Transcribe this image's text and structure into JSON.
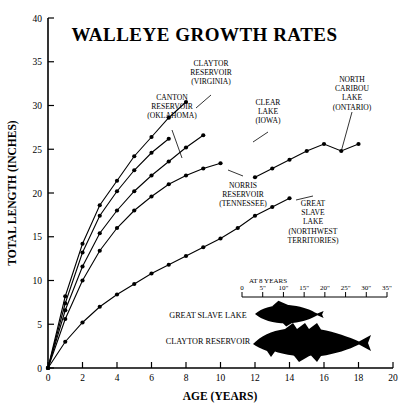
{
  "chart_data": {
    "type": "line",
    "title": "WALLEYE GROWTH RATES",
    "xlabel": "AGE (YEARS)",
    "ylabel": "TOTAL LENGTH (INCHES)",
    "xlim": [
      0,
      20
    ],
    "ylim": [
      0,
      40
    ],
    "xticks": [
      0,
      2,
      4,
      6,
      8,
      10,
      12,
      14,
      16,
      18,
      20
    ],
    "yticks": [
      0,
      5,
      10,
      15,
      20,
      25,
      30,
      35,
      40
    ],
    "grid": false,
    "legend": "inline-annotations",
    "series": [
      {
        "name": "CLAYTOR RESERVOIR (VIRGINIA)",
        "label_lines": [
          "CLAYTOR",
          "RESERVOIR",
          "(VIRGINIA)"
        ],
        "x": [
          0,
          1,
          2,
          3,
          4,
          5,
          6,
          7,
          8
        ],
        "y": [
          0,
          8.2,
          14.2,
          18.6,
          21.4,
          24.2,
          26.4,
          28.6,
          30.4
        ]
      },
      {
        "name": "CANTON RESERVOIR (OKLAHOMA)",
        "label_lines": [
          "CANTON",
          "RESERVOIR",
          "(OKLAHOMA)"
        ],
        "x": [
          0,
          1,
          2,
          3,
          4,
          5,
          6,
          7
        ],
        "y": [
          0,
          7.4,
          13.2,
          17.4,
          20.2,
          22.6,
          24.6,
          26.2
        ]
      },
      {
        "name": "CLEAR LAKE (IOWA)",
        "label_lines": [
          "CLEAR",
          "LAKE",
          "(IOWA)"
        ],
        "x": [
          0,
          1,
          2,
          3,
          4,
          5,
          6,
          7,
          8,
          9
        ],
        "y": [
          0,
          6.6,
          11.6,
          15.4,
          18.0,
          20.2,
          22.0,
          23.6,
          25.2,
          26.6
        ]
      },
      {
        "name": "NORRIS RESERVOIR (TENNESSEE)",
        "label_lines": [
          "NORRIS",
          "RESERVOIR",
          "(TENNESSEE)"
        ],
        "x": [
          0,
          1,
          2,
          3,
          4,
          5,
          6,
          7,
          8,
          9,
          10
        ],
        "y": [
          0,
          5.6,
          10.0,
          13.4,
          16.0,
          18.0,
          19.6,
          21.0,
          22.0,
          22.8,
          23.4
        ]
      },
      {
        "name": "GREAT SLAVE LAKE (NORTHWEST TERRITORIES)",
        "label_lines": [
          "GREAT",
          "SLAVE",
          "LAKE",
          "(NORTHWEST",
          "TERRITORIES)"
        ],
        "x": [
          0,
          1,
          2,
          3,
          4,
          5,
          6,
          7,
          8,
          9,
          10,
          11,
          12,
          13,
          14
        ],
        "y": [
          0,
          3.0,
          5.2,
          7.0,
          8.4,
          9.6,
          10.8,
          11.8,
          12.8,
          13.8,
          14.8,
          16.0,
          17.4,
          18.4,
          19.4
        ]
      },
      {
        "name": "NORTH CARIBOU LAKE (ONTARIO)",
        "label_lines": [
          "NORTH",
          "CARIBOU",
          "LAKE",
          "(ONTARIO)"
        ],
        "x": [
          12,
          13,
          14,
          15,
          16,
          17,
          18
        ],
        "y": [
          21.8,
          22.8,
          23.8,
          24.8,
          25.6,
          24.8,
          25.6
        ]
      }
    ],
    "inset": {
      "title": "AT 8 YEARS",
      "scale_ticks": [
        "0",
        "5\"",
        "10\"",
        "15\"",
        "20\"",
        "25\"",
        "30\"",
        "35\""
      ],
      "fish": [
        {
          "label": "GREAT SLAVE LAKE"
        },
        {
          "label": "CLAYTOR RESERVOIR"
        }
      ]
    }
  }
}
